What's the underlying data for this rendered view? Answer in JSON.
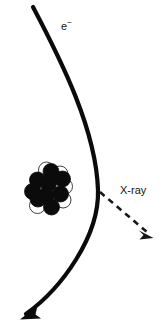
{
  "figure": {
    "background_color": "#ffffff",
    "width": 163,
    "height": 331
  },
  "labels": {
    "electron": {
      "text": "e",
      "superscript": "−",
      "full": "e−",
      "x": 61,
      "y": 27
    },
    "xray": {
      "text": "X-ray",
      "x": 120,
      "y": 191
    }
  },
  "electron_track": {
    "name": "electron-trajectory",
    "color": "#0b0b0b",
    "stroke_width": 4.2,
    "style": "solid",
    "start": [
      33,
      7
    ],
    "apex": [
      98,
      190
    ],
    "end": [
      22,
      318
    ],
    "arrow_at": "end",
    "description": "Curved electron path deflected by the nucleus"
  },
  "xray_photon": {
    "name": "xray-photon",
    "color": "#171717",
    "stroke_width": 2.6,
    "style": "dashed",
    "dash_pattern": "6 5",
    "start": [
      100,
      192
    ],
    "end": [
      152,
      237
    ],
    "arrow_at": "end",
    "description": "Dashed arrow for emitted X-ray photon"
  },
  "nucleus": {
    "name": "atomic-nucleus",
    "center": [
      50,
      189
    ],
    "neutron_color": "#0b0b0b",
    "proton_color": "#ffffff",
    "proton_outline": "#2a2a2a",
    "radius": 8.0,
    "nucleons": [
      {
        "id": "p1",
        "type": "proton",
        "cx": 46.5,
        "cy": 170.0
      },
      {
        "id": "p2",
        "type": "proton",
        "cx": 60.0,
        "cy": 174.0
      },
      {
        "id": "p3",
        "type": "proton",
        "cx": 64.5,
        "cy": 186.5
      },
      {
        "id": "p4",
        "type": "proton",
        "cx": 56.0,
        "cy": 190.0
      },
      {
        "id": "p5",
        "type": "proton",
        "cx": 42.0,
        "cy": 196.0
      },
      {
        "id": "p6",
        "type": "proton",
        "cx": 51.5,
        "cy": 202.5
      },
      {
        "id": "p7",
        "type": "proton",
        "cx": 37.5,
        "cy": 205.5
      },
      {
        "id": "p8",
        "type": "proton",
        "cx": 63.0,
        "cy": 200.0
      },
      {
        "id": "n1",
        "type": "neutron",
        "cx": 51.0,
        "cy": 171.5
      },
      {
        "id": "n2",
        "type": "neutron",
        "cx": 37.5,
        "cy": 180.0
      },
      {
        "id": "n3",
        "type": "neutron",
        "cx": 62.5,
        "cy": 179.0
      },
      {
        "id": "n4",
        "type": "neutron",
        "cx": 48.5,
        "cy": 183.5
      },
      {
        "id": "n5",
        "type": "neutron",
        "cx": 32.5,
        "cy": 191.5
      },
      {
        "id": "n6",
        "type": "neutron",
        "cx": 46.0,
        "cy": 195.5
      },
      {
        "id": "n7",
        "type": "neutron",
        "cx": 60.5,
        "cy": 194.0
      },
      {
        "id": "n8",
        "type": "neutron",
        "cx": 38.0,
        "cy": 199.0
      },
      {
        "id": "n9",
        "type": "neutron",
        "cx": 51.5,
        "cy": 207.0
      },
      {
        "id": "n10",
        "type": "neutron",
        "cx": 64.0,
        "cy": 192.0
      }
    ]
  }
}
